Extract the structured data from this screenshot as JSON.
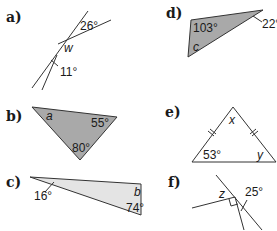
{
  "colors": {
    "triangle_dark": "#a9a9a9",
    "triangle_light": "#e4e4e4",
    "stroke": "#333333"
  },
  "problems": {
    "a": {
      "label": "a)",
      "angles": [
        "26°",
        "11°"
      ],
      "unknown": "w"
    },
    "b": {
      "label": "b)",
      "angles": [
        "55°",
        "80°"
      ],
      "unknown": "a"
    },
    "c": {
      "label": "c)",
      "angles": [
        "16°",
        "74°"
      ],
      "unknown": "b"
    },
    "d": {
      "label": "d)",
      "angles": [
        "103°",
        "22°"
      ],
      "unknown": "c"
    },
    "e": {
      "label": "e)",
      "angles": [
        "53°"
      ],
      "unknowns": [
        "x",
        "y"
      ]
    },
    "f": {
      "label": "f)",
      "angles": [
        "25°"
      ],
      "unknown": "z"
    }
  }
}
